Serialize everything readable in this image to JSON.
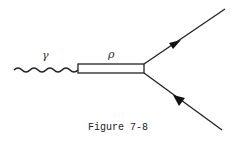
{
  "figure": {
    "caption": "Figure 7-8",
    "labels": {
      "photon": "γ",
      "rho": "ρ"
    }
  },
  "diagram": {
    "type": "feynman",
    "elements": [
      {
        "kind": "wavy-line",
        "name": "photon-propagator",
        "label": "γ"
      },
      {
        "kind": "double-line-box",
        "name": "rho-meson-propagator",
        "label": "ρ"
      },
      {
        "kind": "fermion-line",
        "name": "outgoing-fermion",
        "arrow": "outward"
      },
      {
        "kind": "fermion-line",
        "name": "incoming-antifermion",
        "arrow": "inward"
      }
    ],
    "colors": {
      "line": "#222222",
      "background": "#ffffff"
    }
  }
}
